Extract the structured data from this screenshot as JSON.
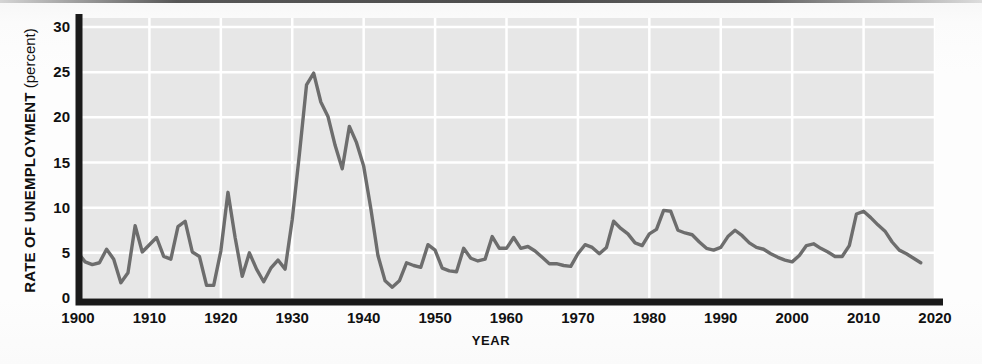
{
  "axes": {
    "ylabel_strong": "RATE OF UNEMPLOYMENT",
    "ylabel_light": " (percent)",
    "xlabel": "YEAR"
  },
  "colors": {
    "plot_background": "#e7e7e7",
    "gridline": "#ffffff",
    "line": "#6d6d6d",
    "axis": "#1a1a1a",
    "text": "#111111"
  },
  "chart_data": {
    "type": "line",
    "title": "",
    "subtitle": "",
    "xlabel": "YEAR",
    "ylabel": "RATE OF UNEMPLOYMENT (percent)",
    "xlim": [
      1900,
      2020
    ],
    "ylim": [
      0,
      31
    ],
    "xticks": [
      1900,
      1910,
      1920,
      1930,
      1940,
      1950,
      1960,
      1970,
      1980,
      1990,
      2000,
      2010,
      2020
    ],
    "yticks": [
      0,
      5,
      10,
      15,
      20,
      25,
      30
    ],
    "grid": true,
    "legend": null,
    "series": [
      {
        "name": "Rate of unemployment",
        "color": "#6d6d6d",
        "x": [
          1900,
          1901,
          1902,
          1903,
          1904,
          1905,
          1906,
          1907,
          1908,
          1909,
          1910,
          1911,
          1912,
          1913,
          1914,
          1915,
          1916,
          1917,
          1918,
          1919,
          1920,
          1921,
          1922,
          1923,
          1924,
          1925,
          1926,
          1927,
          1928,
          1929,
          1930,
          1931,
          1932,
          1933,
          1934,
          1935,
          1936,
          1937,
          1938,
          1939,
          1940,
          1941,
          1942,
          1943,
          1944,
          1945,
          1946,
          1947,
          1948,
          1949,
          1950,
          1951,
          1952,
          1953,
          1954,
          1955,
          1956,
          1957,
          1958,
          1959,
          1960,
          1961,
          1962,
          1963,
          1964,
          1965,
          1966,
          1967,
          1968,
          1969,
          1970,
          1971,
          1972,
          1973,
          1974,
          1975,
          1976,
          1977,
          1978,
          1979,
          1980,
          1981,
          1982,
          1983,
          1984,
          1985,
          1986,
          1987,
          1988,
          1989,
          1990,
          1991,
          1992,
          1993,
          1994,
          1995,
          1996,
          1997,
          1998,
          1999,
          2000,
          2001,
          2002,
          2003,
          2004,
          2005,
          2006,
          2007,
          2008,
          2009,
          2010,
          2011,
          2012,
          2013,
          2014,
          2015,
          2016,
          2017,
          2018
        ],
        "y": [
          5.0,
          4.0,
          3.7,
          3.9,
          5.4,
          4.3,
          1.7,
          2.8,
          8.0,
          5.1,
          5.9,
          6.7,
          4.6,
          4.3,
          7.9,
          8.5,
          5.1,
          4.6,
          1.4,
          1.4,
          5.2,
          11.7,
          6.7,
          2.4,
          5.0,
          3.2,
          1.8,
          3.3,
          4.2,
          3.2,
          8.7,
          15.9,
          23.6,
          24.9,
          21.7,
          20.1,
          16.9,
          14.3,
          19.0,
          17.2,
          14.6,
          9.9,
          4.7,
          1.9,
          1.2,
          1.9,
          3.9,
          3.6,
          3.4,
          5.9,
          5.3,
          3.3,
          3.0,
          2.9,
          5.5,
          4.4,
          4.1,
          4.3,
          6.8,
          5.5,
          5.5,
          6.7,
          5.5,
          5.7,
          5.2,
          4.5,
          3.8,
          3.8,
          3.6,
          3.5,
          4.9,
          5.9,
          5.6,
          4.9,
          5.6,
          8.5,
          7.7,
          7.1,
          6.1,
          5.8,
          7.1,
          7.6,
          9.7,
          9.6,
          7.5,
          7.2,
          7.0,
          6.2,
          5.5,
          5.3,
          5.6,
          6.8,
          7.5,
          6.9,
          6.1,
          5.6,
          5.4,
          4.9,
          4.5,
          4.2,
          4.0,
          4.7,
          5.8,
          6.0,
          5.5,
          5.1,
          4.6,
          4.6,
          5.8,
          9.3,
          9.6,
          8.9,
          8.1,
          7.4,
          6.2,
          5.3,
          4.9,
          4.4,
          3.9
        ]
      }
    ]
  }
}
